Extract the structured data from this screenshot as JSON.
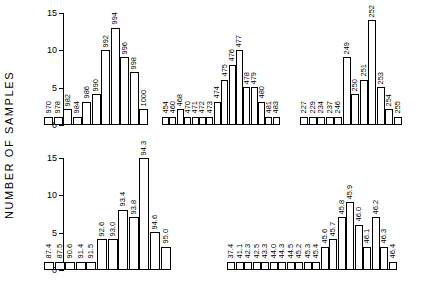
{
  "axis": {
    "y_title": "NUMBER  OF  SAMPLES",
    "ticks": [
      "0",
      "5",
      "10",
      "15"
    ],
    "tick_values": [
      0,
      5,
      10,
      15
    ],
    "ymax": 15
  },
  "chart_data": {
    "type": "bar",
    "title": "",
    "xlabel": "",
    "ylabel": "NUMBER OF SAMPLES",
    "ylim": [
      0,
      15
    ],
    "grid": false,
    "legend": "none",
    "layout": "2 rows x 2 columns of panels; row 1 holds 3 histogram groups, row 2 holds 2 histogram groups",
    "panels": [
      {
        "id": "panel-1",
        "row": 1,
        "categories": [
          "970",
          "978",
          "982",
          "984",
          "986",
          "990",
          "992",
          "994",
          "996",
          "998",
          "1000"
        ],
        "values": [
          1,
          1,
          2,
          1,
          3,
          4,
          10,
          13,
          9,
          7,
          2
        ]
      },
      {
        "id": "panel-2",
        "row": 1,
        "categories": [
          "454",
          "460",
          "468",
          "470",
          "471",
          "472",
          "473",
          "474",
          "475",
          "476",
          "477",
          "478",
          "479",
          "480",
          "481",
          "483"
        ],
        "values": [
          1,
          1,
          2,
          1,
          1,
          1,
          1,
          3,
          6,
          8,
          10,
          5,
          5,
          3,
          1,
          1
        ]
      },
      {
        "id": "panel-3",
        "row": 1,
        "categories": [
          "227",
          "229",
          "234",
          "237",
          "246",
          "249",
          "250",
          "251",
          "252",
          "253",
          "254",
          "255"
        ],
        "values": [
          1,
          1,
          1,
          1,
          1,
          9,
          4,
          6,
          14,
          5,
          2,
          1
        ]
      },
      {
        "id": "panel-4",
        "row": 2,
        "categories": [
          "87.4",
          "87.5",
          "90.6",
          "91.4",
          "91.5",
          "92.6",
          "93.0",
          "93.4",
          "93.8",
          "94.3",
          "94.6",
          "95.0"
        ],
        "values": [
          1,
          1,
          1,
          1,
          1,
          4,
          4,
          8,
          7,
          15,
          5,
          3
        ]
      },
      {
        "id": "panel-5",
        "row": 2,
        "categories": [
          "37.4",
          "41.1",
          "42.3",
          "42.5",
          "43.3",
          "44.0",
          "44.3",
          "44.5",
          "45.2",
          "45.3",
          "45.4",
          "45.6",
          "45.7",
          "45.8",
          "45.9",
          "46.0",
          "46.1",
          "46.2",
          "46.3",
          "46.4"
        ],
        "values": [
          1,
          1,
          1,
          1,
          1,
          1,
          1,
          1,
          1,
          1,
          1,
          3,
          4,
          7,
          9,
          6,
          3,
          7,
          3,
          1
        ]
      }
    ]
  }
}
